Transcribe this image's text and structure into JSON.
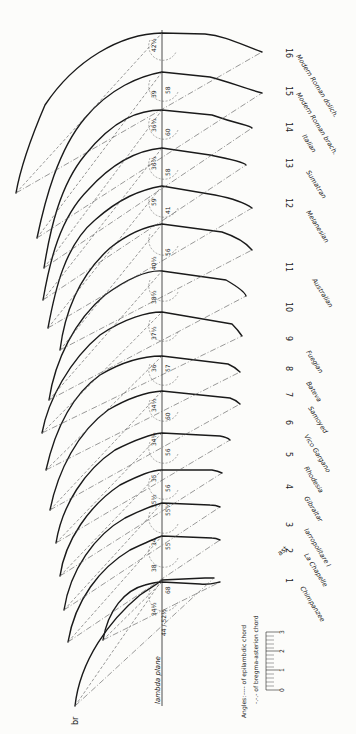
{
  "figure": {
    "orientation": "rotated-90-clockwise",
    "reference_line_label": "lambda plane",
    "point_label": "br",
    "ast_label": "ast",
    "legend": {
      "title": "Angles:",
      "epilambdic": "---- of epilambdic chord",
      "bregma_asterion": "-.-.- of bregma-asterion chord"
    },
    "scale": {
      "ticks": [
        "0",
        "1",
        "2",
        "3"
      ]
    }
  },
  "specimens": [
    {
      "number": "1",
      "name": "Chimpanzee",
      "angle_epilambdic": "68",
      "angle_bregma_asterion": "34½",
      "extra": "44 / 52½"
    },
    {
      "number": "2",
      "name": "La Chapelle",
      "angle_epilambdic": "55",
      "angle_bregma_asterion": "38"
    },
    {
      "number": "3",
      "name": "Iarropolitare I",
      "angle_epilambdic": "55",
      "angle_bregma_asterion": "34"
    },
    {
      "number": "4",
      "name": "Gibraltar",
      "angle_epilambdic": "55½",
      "angle_bregma_asterion": "35½"
    },
    {
      "number": "5",
      "name": "Rhodesia",
      "angle_epilambdic": "56",
      "angle_bregma_asterion": "35"
    },
    {
      "number": "6",
      "name": "Vico Gargano",
      "angle_epilambdic": "56",
      "angle_bregma_asterion": "34½"
    },
    {
      "number": "7",
      "name": "Samoyed",
      "angle_epilambdic": "60",
      "angle_bregma_asterion": "34½"
    },
    {
      "number": "8",
      "name": "Bateva",
      "angle_epilambdic": "57",
      "angle_bregma_asterion": "36"
    },
    {
      "number": "9",
      "name": "Fuegian",
      "angle_epilambdic": "59",
      "angle_bregma_asterion": "37½"
    },
    {
      "number": "10",
      "name": "Australian",
      "angle_epilambdic": "58",
      "angle_bregma_asterion": "38½"
    },
    {
      "number": "11",
      "name": "Eskimo",
      "angle_epilambdic": "56",
      "angle_bregma_asterion": "40½"
    },
    {
      "number": "12",
      "name": "Melanesian",
      "angle_epilambdic": "59",
      "angle_bregma_asterion": "41"
    },
    {
      "number": "13",
      "name": "Sumatran",
      "angle_epilambdic": "58",
      "angle_bregma_asterion": "36½"
    },
    {
      "number": "14",
      "name": "Italian",
      "angle_epilambdic": "60",
      "angle_bregma_asterion": "36½"
    },
    {
      "number": "15",
      "name": "Modern Roman brach.",
      "angle_epilambdic": "58",
      "angle_bregma_asterion": "39"
    },
    {
      "number": "16",
      "name": "Modern Roman dolich.",
      "angle_epilambdic": "58",
      "angle_bregma_asterion": "39½",
      "extra": "42½"
    }
  ]
}
